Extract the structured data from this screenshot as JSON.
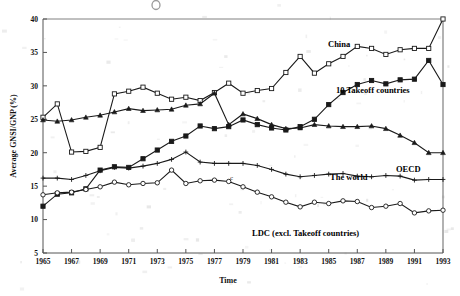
{
  "chart_data": {
    "type": "line",
    "title": "",
    "xlabel": "Time",
    "ylabel": "Average GNSI/GNP (%)",
    "xlim": [
      1965,
      1993
    ],
    "ylim": [
      5,
      40
    ],
    "ytick_step": 5,
    "yticks": [
      5,
      10,
      15,
      20,
      25,
      30,
      35,
      40
    ],
    "xticks": [
      1965,
      1967,
      1969,
      1971,
      1973,
      1975,
      1977,
      1979,
      1981,
      1983,
      1985,
      1987,
      1989,
      1991,
      1993
    ],
    "x": [
      1965,
      1966,
      1967,
      1968,
      1969,
      1970,
      1971,
      1972,
      1973,
      1974,
      1975,
      1976,
      1977,
      1978,
      1979,
      1980,
      1981,
      1982,
      1983,
      1984,
      1985,
      1986,
      1987,
      1988,
      1989,
      1990,
      1991,
      1992,
      1993
    ],
    "grid": false,
    "legend_position": "inline-labels",
    "annotation": "c",
    "series": [
      {
        "name": "China",
        "marker": "open-square",
        "values": [
          25.3,
          27.3,
          20.1,
          20.2,
          20.8,
          28.8,
          29.2,
          29.8,
          28.9,
          28.0,
          28.3,
          27.8,
          29.0,
          30.4,
          28.9,
          29.3,
          29.6,
          32.0,
          34.4,
          31.9,
          33.3,
          34.4,
          35.9,
          35.6,
          34.7,
          35.4,
          35.6,
          35.6,
          40.0
        ]
      },
      {
        "name": "10 Takeoff countries",
        "marker": "filled-square",
        "values": [
          12.0,
          13.8,
          14.0,
          14.6,
          17.4,
          17.9,
          17.8,
          19.1,
          20.4,
          21.7,
          22.5,
          24.0,
          23.6,
          23.9,
          24.9,
          24.2,
          23.7,
          23.4,
          23.9,
          25.0,
          27.2,
          29.0,
          30.2,
          30.8,
          30.3,
          30.9,
          31.0,
          33.8,
          30.2
        ]
      },
      {
        "name": "OECD",
        "marker": "filled-triangle",
        "values": [
          24.9,
          24.7,
          24.9,
          25.3,
          25.6,
          26.1,
          26.6,
          26.3,
          26.4,
          26.5,
          27.1,
          27.3,
          28.9,
          24.2,
          25.8,
          25.1,
          24.2,
          23.6,
          23.7,
          24.2,
          24.0,
          23.9,
          23.9,
          24.0,
          23.6,
          22.6,
          21.5,
          20.0,
          20.0
        ]
      },
      {
        "name": "The world",
        "marker": "plus",
        "values": [
          16.2,
          16.2,
          16.0,
          16.6,
          17.3,
          17.8,
          17.7,
          18.0,
          18.4,
          19.0,
          20.1,
          18.6,
          18.4,
          18.4,
          18.4,
          18.1,
          17.5,
          16.8,
          16.4,
          16.6,
          16.8,
          16.9,
          16.5,
          16.4,
          16.6,
          16.5,
          15.9,
          16.0,
          16.0
        ]
      },
      {
        "name": "LDC (excl. Takeoff countries)",
        "marker": "open-circle",
        "values": [
          13.7,
          14.0,
          14.1,
          14.5,
          14.9,
          15.6,
          15.2,
          15.4,
          15.5,
          17.4,
          15.4,
          15.8,
          15.9,
          15.7,
          14.9,
          14.1,
          13.4,
          12.6,
          11.9,
          12.6,
          12.4,
          12.8,
          12.7,
          11.8,
          12.0,
          12.4,
          11.0,
          11.3,
          11.4
        ]
      }
    ]
  },
  "labels": {
    "china": "China",
    "takeoff": "10 Takeoff countries",
    "oecd": "OECD",
    "world": "The  world",
    "ldc": "LDC (excl. Takeoff countries)",
    "annotation_c": "c",
    "xaxis_title": "Time",
    "yaxis_title": "Average GNSI/GNP (%)"
  }
}
